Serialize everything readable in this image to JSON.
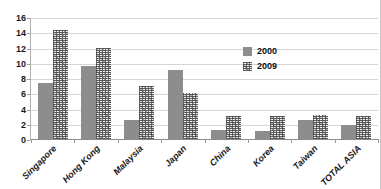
{
  "chart_data": {
    "type": "bar",
    "title": "",
    "subtitle": "",
    "xlabel": "",
    "ylabel": "",
    "ylim": [
      0,
      16
    ],
    "ytick_step": 2,
    "yticks": [
      0,
      2,
      4,
      6,
      8,
      10,
      12,
      14,
      16
    ],
    "grid": true,
    "legend_position": "center-right",
    "categories": [
      "Singapore",
      "Hong Kong",
      "Malaysia",
      "Japan",
      "China",
      "Korea",
      "Taiwan",
      "TOTAL ASIA"
    ],
    "series": [
      {
        "name": "2000",
        "fill": "solid",
        "color": "#8d8d8d",
        "values": [
          7.4,
          9.6,
          2.5,
          9.0,
          1.2,
          1.1,
          2.5,
          1.8
        ]
      },
      {
        "name": "2009",
        "fill": "textured",
        "color": "#f2f2f2",
        "values": [
          14.3,
          12.0,
          7.0,
          6.1,
          3.0,
          3.0,
          3.1,
          3.0
        ]
      }
    ]
  },
  "legend": {
    "items": [
      {
        "label": "2000"
      },
      {
        "label": "2009"
      }
    ]
  }
}
